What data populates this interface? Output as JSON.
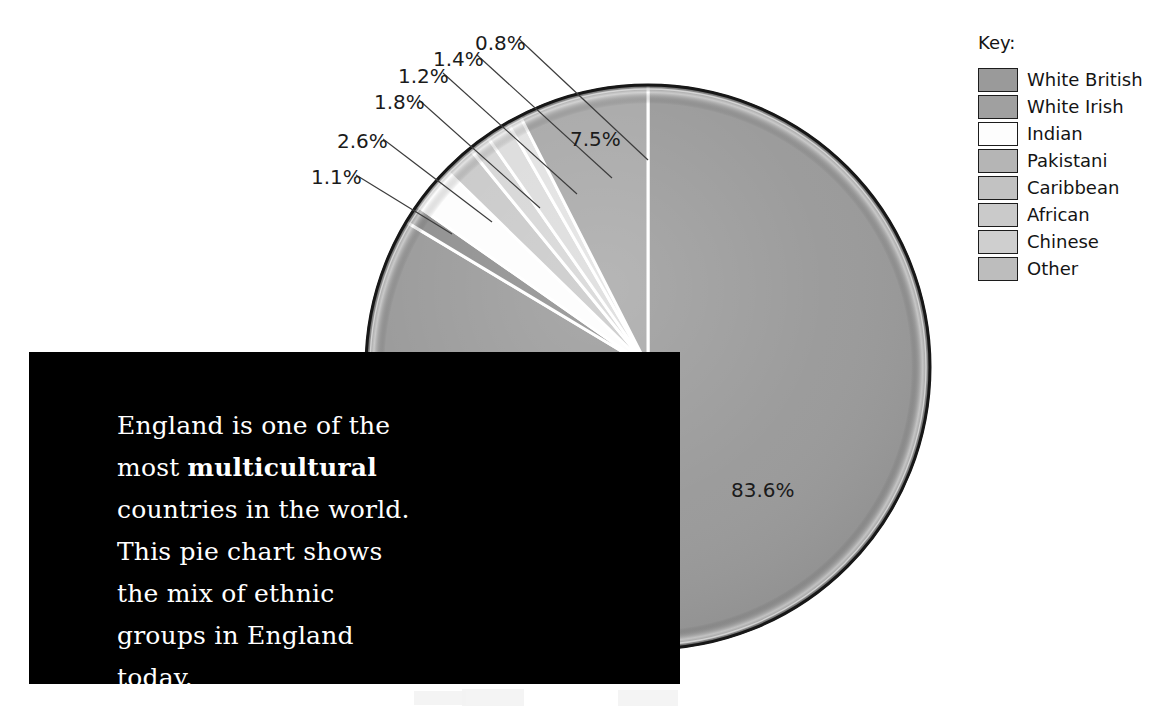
{
  "chart_data": {
    "type": "pie",
    "title": "",
    "unit": "%",
    "total": 100.0,
    "start_angle_deg": 0,
    "direction": "counterclockwise",
    "legend_position": "right",
    "legend_title": "Key:",
    "categories": [
      "White British",
      "White Irish",
      "Indian",
      "Pakistani",
      "Caribbean",
      "African",
      "Chinese",
      "Other"
    ],
    "values": [
      83.6,
      1.1,
      2.6,
      1.8,
      1.2,
      1.4,
      0.8,
      7.5
    ],
    "labels": [
      "83.6%",
      "1.1%",
      "2.6%",
      "1.8%",
      "1.2%",
      "1.4%",
      "0.8%",
      "7.5%"
    ],
    "colors": [
      "#9a9a9a",
      "#8f8f8f",
      "#fdfdfd",
      "#c9c9c9",
      "#d6d6d6",
      "#dcdcdc",
      "#e2e2e2",
      "#a8a8a8"
    ],
    "slices": [
      {
        "name": "White British",
        "value": 83.6,
        "label": "83.6%",
        "color": "#9a9a9a",
        "label_inside": true,
        "label_x": 765,
        "label_y": 490
      },
      {
        "name": "White Irish",
        "value": 1.1,
        "label": "1.1%",
        "color": "#8f8f8f",
        "label_inside": false,
        "label_x": 313,
        "label_y": 167
      },
      {
        "name": "Indian",
        "value": 2.6,
        "label": "2.6%",
        "color": "#fdfdfd",
        "label_inside": false,
        "label_x": 339,
        "label_y": 131
      },
      {
        "name": "Pakistani",
        "value": 1.8,
        "label": "1.8%",
        "color": "#c9c9c9",
        "label_inside": false,
        "label_x": 376,
        "label_y": 92
      },
      {
        "name": "Caribbean",
        "value": 1.2,
        "label": "1.2%",
        "color": "#d6d6d6",
        "label_inside": false,
        "label_x": 399,
        "label_y": 65
      },
      {
        "name": "African",
        "value": 1.4,
        "label": "1.4%",
        "color": "#dcdcdc",
        "label_inside": false,
        "label_x": 434,
        "label_y": 47
      },
      {
        "name": "Chinese",
        "value": 0.8,
        "label": "0.8%",
        "color": "#e2e2e2",
        "label_inside": false,
        "label_x": 475,
        "label_y": 32
      },
      {
        "name": "Other",
        "value": 7.5,
        "label": "7.5%",
        "color": "#a8a8a8",
        "label_inside": true,
        "label_x": 570,
        "label_y": 128
      }
    ]
  },
  "legend": {
    "title": "Key:",
    "items": [
      {
        "label": "White British",
        "color": "#9a9a9a"
      },
      {
        "label": "White Irish",
        "color": "#a0a0a0"
      },
      {
        "label": "Indian",
        "color": "#fdfdfd"
      },
      {
        "label": "Pakistani",
        "color": "#b5b5b5"
      },
      {
        "label": "Caribbean",
        "color": "#c2c2c2"
      },
      {
        "label": "African",
        "color": "#cacaca"
      },
      {
        "label": "Chinese",
        "color": "#cfcfcf"
      },
      {
        "label": "Other",
        "color": "#bdbdbd"
      }
    ]
  },
  "caption": {
    "line1": "England is one of the",
    "line2_prefix": "most ",
    "line2_bold": "multicultural",
    "line3": "countries in the world.",
    "line4": "This pie chart shows the",
    "line5": "mix of ethnic groups in",
    "line6": "England today.",
    "full_text": "England is one of the most multicultural countries in the world. This pie chart shows the mix of ethnic groups in England today."
  },
  "pct_labels": {
    "l0": "0.8%",
    "l1": "1.4%",
    "l2": "1.2%",
    "l3": "1.8%",
    "l4": "2.6%",
    "l5": "1.1%",
    "l6": "7.5%",
    "l7": "83.6%"
  },
  "colors": {
    "background": "#ffffff",
    "caption_bg": "#000000",
    "caption_fg": "#ffffff",
    "text": "#141414",
    "pie_rim": "#141414"
  }
}
